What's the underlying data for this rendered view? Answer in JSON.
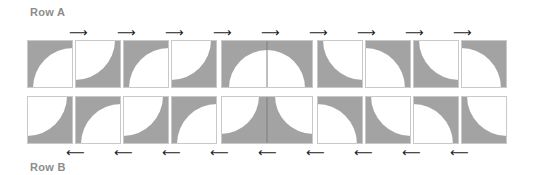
{
  "labels": {
    "row_a": "Row A",
    "row_b": "Row B"
  },
  "colors": {
    "fill": "#a3a3a3",
    "border": "#c9c9c9",
    "background": "#ffffff",
    "arrow": "#222222",
    "label": "#8c8c8c"
  },
  "arrows": {
    "right": "⟶",
    "left": "⟵"
  },
  "row_a": {
    "direction": "right",
    "tiles": [
      {
        "type": "gray-white-arc-bottom-right"
      },
      {
        "type": "white-arc-top-left"
      },
      {
        "type": "gray-white-arc-bottom-right"
      },
      {
        "type": "white-arc-top-left"
      },
      {
        "type": "double-semicircle-bottom"
      },
      {
        "type": "gray-white-arc-top-right"
      },
      {
        "type": "white-arc-bottom-left"
      },
      {
        "type": "gray-white-arc-top-right"
      },
      {
        "type": "white-arc-bottom-left"
      }
    ],
    "arrow_count": 9
  },
  "row_b": {
    "direction": "left",
    "tiles": [
      {
        "type": "white-arc-top-left"
      },
      {
        "type": "gray-white-arc-bottom-right"
      },
      {
        "type": "white-arc-top-left"
      },
      {
        "type": "gray-white-arc-bottom-right"
      },
      {
        "type": "double-quarter-top-corners"
      },
      {
        "type": "white-arc-bottom-left"
      },
      {
        "type": "gray-white-arc-top-right"
      },
      {
        "type": "white-arc-bottom-left"
      },
      {
        "type": "gray-white-arc-top-right"
      }
    ],
    "arrow_count": 9
  }
}
